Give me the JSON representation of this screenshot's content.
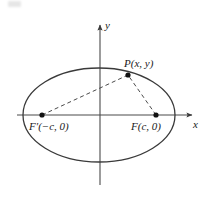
{
  "figure": {
    "name": "ellipse-foci-diagram",
    "colors": {
      "curve": "#3a3a3a",
      "axis": "#4a4a4a",
      "dashed": "#4a4a4a",
      "point": "#111111",
      "text": "#1a1a1a",
      "background": "#ffffff"
    },
    "axes": {
      "x_label": "x",
      "y_label": "y",
      "origin": {
        "x": 99,
        "y": 115
      }
    },
    "ellipse": {
      "center_x": 99,
      "center_y": 115,
      "radius_x": 76,
      "radius_y": 47
    },
    "points": [
      {
        "id": "left-focus",
        "label_prefix": "F",
        "label_prime": "′",
        "label_coords": "(−c, 0)",
        "label_full": "F′(−c, 0)",
        "x": 42,
        "y": 115
      },
      {
        "id": "right-focus",
        "label_prefix": "F",
        "label_prime": "",
        "label_coords": "(c, 0)",
        "label_full": "F(c, 0)",
        "x": 156,
        "y": 115
      },
      {
        "id": "curve-point",
        "label_prefix": "P",
        "label_prime": "",
        "label_coords": "(x, y)",
        "label_full": "P(x, y)",
        "x": 128,
        "y": 75
      }
    ],
    "segments": [
      {
        "id": "focal-radius-left",
        "from": "left-focus",
        "to": "curve-point",
        "style": "dashed"
      },
      {
        "id": "focal-radius-right",
        "from": "right-focus",
        "to": "curve-point",
        "style": "dashed"
      }
    ]
  }
}
